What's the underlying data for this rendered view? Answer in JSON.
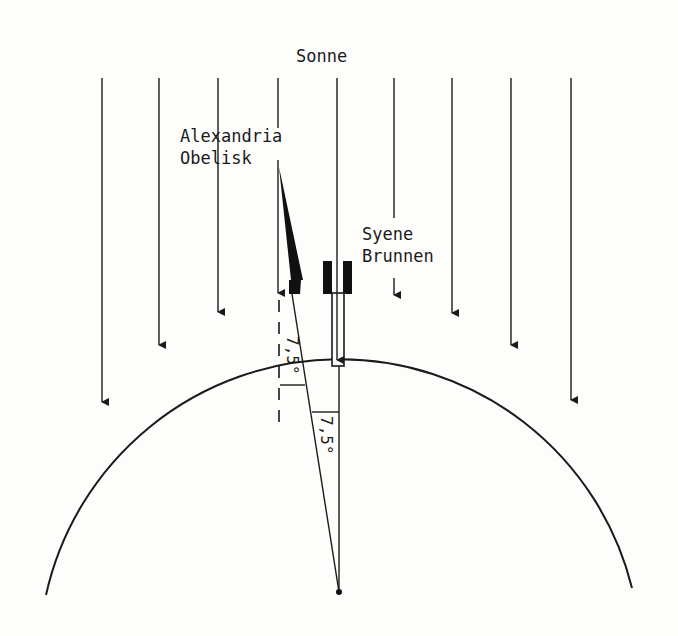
{
  "labels": {
    "sun": "Sonne",
    "alexandria_line1": "Alexandria",
    "alexandria_line2": "Obelisk",
    "syene_line1": "Syene",
    "syene_line2": "Brunnen",
    "angle_shadow": "7,5°",
    "angle_center": "7,5°"
  },
  "geometry": {
    "earth_center": [
      339,
      592
    ],
    "earth_radius": 301,
    "sun_rays": [
      {
        "x": 102,
        "y_end": 402
      },
      {
        "x": 159,
        "y_end": 345
      },
      {
        "x": 218,
        "y_end": 312
      },
      {
        "x": 278,
        "y_end": 293
      },
      {
        "x": 337,
        "y_end": 360
      },
      {
        "x": 394,
        "y_end": 295
      },
      {
        "x": 452,
        "y_end": 313
      },
      {
        "x": 511,
        "y_end": 345
      },
      {
        "x": 571,
        "y_end": 400
      }
    ],
    "ray_top": 78
  },
  "colors": {
    "ink": "#1a1a1a",
    "paper": "#fdfdfb"
  }
}
